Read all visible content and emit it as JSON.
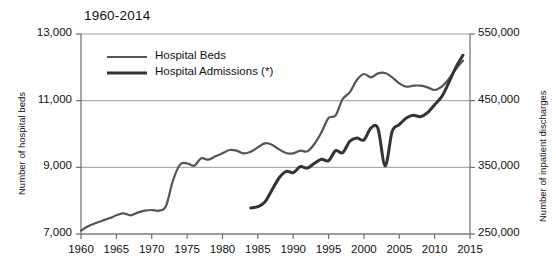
{
  "chart_data": {
    "type": "line",
    "title": "1960-2014",
    "xlabel": "",
    "ylabel": "Number of hospital beds",
    "ylabel_right": "Number of inpatient discharges",
    "xlim": [
      1960,
      2015
    ],
    "ylim": [
      7000,
      13000
    ],
    "ylim_right": [
      250000,
      550000
    ],
    "xticks": [
      1960,
      1965,
      1970,
      1975,
      1980,
      1985,
      1990,
      1995,
      2000,
      2005,
      2010,
      2015
    ],
    "xticklabels": [
      "1960",
      "1965",
      "1970",
      "1975",
      "1980",
      "1985",
      "1990",
      "1995",
      "2000",
      "2005",
      "2010",
      "2015"
    ],
    "yticks": [
      7000,
      9000,
      11000,
      13000
    ],
    "yticklabels": [
      "7,000",
      "9,000",
      "11,000",
      "13,000"
    ],
    "yticks_right": [
      250000,
      350000,
      450000,
      550000
    ],
    "yticklabels_right": [
      "250,000",
      "350,000",
      "450,000",
      "550,000"
    ],
    "grid": true,
    "legend_position": "top-left-inside",
    "series": [
      {
        "name": "Hospital Beds",
        "axis": "left",
        "color": "#555555",
        "linewidth": 2.2,
        "x": [
          1960,
          1961,
          1962,
          1963,
          1964,
          1965,
          1966,
          1967,
          1968,
          1969,
          1970,
          1971,
          1972,
          1973,
          1974,
          1975,
          1976,
          1977,
          1978,
          1979,
          1980,
          1981,
          1982,
          1983,
          1984,
          1985,
          1986,
          1987,
          1988,
          1989,
          1990,
          1991,
          1992,
          1993,
          1994,
          1995,
          1996,
          1997,
          1998,
          1999,
          2000,
          2001,
          2002,
          2003,
          2004,
          2005,
          2006,
          2007,
          2008,
          2009,
          2010,
          2011,
          2012,
          2013,
          2014
        ],
        "y": [
          7100,
          7230,
          7320,
          7400,
          7470,
          7560,
          7620,
          7560,
          7640,
          7700,
          7720,
          7700,
          7830,
          8600,
          9080,
          9120,
          9050,
          9270,
          9230,
          9330,
          9420,
          9520,
          9500,
          9420,
          9470,
          9600,
          9720,
          9680,
          9540,
          9430,
          9420,
          9500,
          9480,
          9700,
          10050,
          10480,
          10560,
          11050,
          11250,
          11620,
          11800,
          11700,
          11820,
          11830,
          11700,
          11520,
          11420,
          11450,
          11450,
          11400,
          11320,
          11420,
          11650,
          11950,
          12200
        ]
      },
      {
        "name": "Hospital Admissions (*)",
        "axis": "right",
        "color": "#333333",
        "linewidth": 3.0,
        "x": [
          1984,
          1985,
          1986,
          1987,
          1988,
          1989,
          1990,
          1991,
          1992,
          1993,
          1994,
          1995,
          1996,
          1997,
          1998,
          1999,
          2000,
          2001,
          2002,
          2003,
          2004,
          2005,
          2006,
          2007,
          2008,
          2009,
          2010,
          2011,
          2012,
          2013,
          2014
        ],
        "y": [
          289000,
          291000,
          298000,
          316000,
          334000,
          344000,
          342000,
          351000,
          349000,
          356000,
          362000,
          360000,
          375000,
          372000,
          389000,
          394000,
          391000,
          409000,
          408000,
          352000,
          404000,
          414000,
          424000,
          428000,
          426000,
          432000,
          444000,
          456000,
          477000,
          500000,
          518000
        ]
      }
    ]
  },
  "legend": {
    "items": [
      {
        "label": "Hospital Beds"
      },
      {
        "label": "Hospital Admissions (*)"
      }
    ]
  }
}
